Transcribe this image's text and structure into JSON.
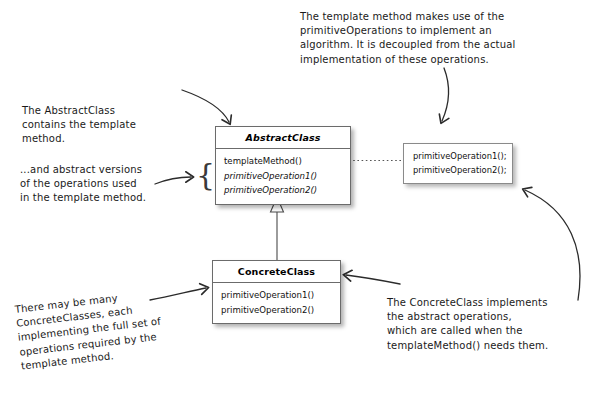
{
  "diagram": {
    "classes": [
      {
        "id": "abstract-class",
        "name": "AbstractClass",
        "stereotype": "abstract",
        "methods": [
          {
            "label": "templateMethod()",
            "abstract": false
          },
          {
            "label": "primitiveOperation1()",
            "abstract": true
          },
          {
            "label": "primitiveOperation2()",
            "abstract": true
          }
        ]
      },
      {
        "id": "concrete-class",
        "name": "ConcreteClass",
        "stereotype": "concrete",
        "methods": [
          {
            "label": "primitiveOperation1()",
            "abstract": false
          },
          {
            "label": "primitiveOperation2()",
            "abstract": false
          }
        ]
      }
    ],
    "code_box": {
      "lines": [
        "primitiveOperation1();",
        "primitiveOperation2();"
      ]
    },
    "brace_glyph": "{",
    "annotations": [
      {
        "id": "note-template-method",
        "lines": [
          "The template method makes use of the",
          "primitiveOperations to implement an",
          "algorithm.  It is decoupled from the actual",
          "implementation of these operations."
        ]
      },
      {
        "id": "note-abstract-class",
        "lines": [
          "The AbstractClass",
          "contains the template",
          "method."
        ]
      },
      {
        "id": "note-abstract-operations",
        "lines": [
          "...and abstract versions",
          "of the operations used",
          "in the template method."
        ]
      },
      {
        "id": "note-concrete-classes",
        "lines": [
          "There may be many",
          "ConcreteClasses, each",
          "implementing the full set of",
          "operations required by the",
          "template method."
        ]
      },
      {
        "id": "note-concrete-implements",
        "lines": [
          "The ConcreteClass implements",
          "the abstract operations,",
          "which are called when the",
          "templateMethod() needs them."
        ]
      }
    ],
    "connectors": [
      {
        "id": "inheritance-arrow",
        "kind": "uml-generalization",
        "from": "ConcreteClass",
        "to": "AbstractClass"
      },
      {
        "id": "dotted-link",
        "kind": "dotted-callout",
        "from": "templateMethod()",
        "to": "code-box"
      }
    ],
    "colors": {
      "ink": "#1a1a1a",
      "box_border": "#6b6b6b",
      "background": "#ffffff",
      "shadow": "rgba(0,0,0,0.30)"
    }
  }
}
